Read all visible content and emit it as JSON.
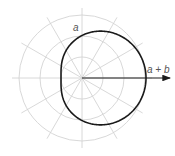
{
  "diagram": {
    "type": "polar-limacon",
    "center": [
      82,
      78
    ],
    "grid": {
      "circle_radii": [
        21,
        42,
        63
      ],
      "radial_angle_step_deg": 30,
      "radial_length": 70,
      "color": "#d4d4d4"
    },
    "curve": {
      "equation": "r = a + b cos(theta)",
      "a": 42.5,
      "b": 21.5,
      "color": "#1a1a1a"
    },
    "arrow": {
      "from": [
        82,
        78
      ],
      "to": [
        170,
        78
      ]
    },
    "labels": {
      "a": "a",
      "a_plus_b": "a + b"
    }
  }
}
